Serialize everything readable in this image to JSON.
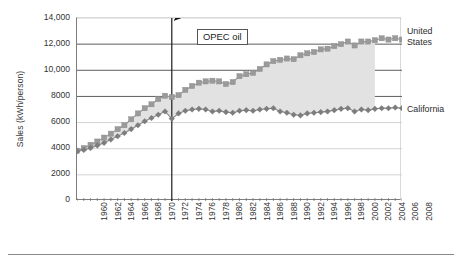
{
  "chart_data": {
    "type": "line",
    "title": "",
    "subtitle": "",
    "xlabel": "",
    "ylabel": "Sales (kWh/person)",
    "xlim": [
      1960,
      2008
    ],
    "ylim": [
      0,
      14000
    ],
    "grid": true,
    "legend_position": "right-of-plot-endpoint-labels",
    "ytick_labels": [
      "14,000",
      "12,000",
      "10,000",
      "8000",
      "6000",
      "4000",
      "2000",
      "0"
    ],
    "ytick_values": [
      14000,
      12000,
      10000,
      8000,
      6000,
      4000,
      2000,
      0
    ],
    "xtick_labels": [
      "1960",
      "1962",
      "1964",
      "1966",
      "1968",
      "1970",
      "1972",
      "1974",
      "1976",
      "1978",
      "1980",
      "1982",
      "1984",
      "1986",
      "1988",
      "1990",
      "1992",
      "1994",
      "1996",
      "1998",
      "2000",
      "2002",
      "2004",
      "2006",
      "2008"
    ],
    "x": [
      1960,
      1961,
      1962,
      1963,
      1964,
      1965,
      1966,
      1967,
      1968,
      1969,
      1970,
      1971,
      1972,
      1973,
      1974,
      1975,
      1976,
      1977,
      1978,
      1979,
      1980,
      1981,
      1982,
      1983,
      1984,
      1985,
      1986,
      1987,
      1988,
      1989,
      1990,
      1991,
      1992,
      1993,
      1994,
      1995,
      1996,
      1997,
      1998,
      1999,
      2000,
      2001,
      2002,
      2003,
      2004,
      2005,
      2006,
      2007,
      2008
    ],
    "series": [
      {
        "name": "United States",
        "marker": "square",
        "color": "#9a9a9a",
        "values": [
          3850,
          4050,
          4300,
          4550,
          4850,
          5150,
          5500,
          5800,
          6250,
          6700,
          7100,
          7400,
          7800,
          8050,
          7950,
          8100,
          8500,
          8800,
          9050,
          9150,
          9200,
          9150,
          8950,
          9100,
          9550,
          9700,
          9800,
          10100,
          10450,
          10700,
          10800,
          10900,
          10850,
          11150,
          11300,
          11400,
          11600,
          11650,
          11850,
          12000,
          12200,
          11900,
          12200,
          12200,
          12300,
          12450,
          12350,
          12450,
          12350
        ]
      },
      {
        "name": "California",
        "marker": "diamond",
        "color": "#8e8e8e",
        "values": [
          3800,
          3900,
          4050,
          4250,
          4450,
          4700,
          4950,
          5200,
          5500,
          5800,
          6100,
          6350,
          6600,
          6850,
          6300,
          6700,
          6900,
          7000,
          7050,
          7000,
          6850,
          6900,
          6800,
          6750,
          6900,
          6950,
          6900,
          7000,
          7050,
          7100,
          6850,
          6750,
          6600,
          6550,
          6700,
          6750,
          6800,
          6850,
          6950,
          7050,
          7100,
          6850,
          7000,
          6950,
          7050,
          7100,
          7100,
          7150,
          7100
        ]
      }
    ],
    "fill_between": {
      "label": "shaded gap between series",
      "color": "#e2e2e2",
      "x_start": 1960,
      "x_end": 2004
    },
    "annotations": [
      {
        "name": "opec-oil-callout",
        "text": "OPEC oil",
        "points_to_year": 1974,
        "vertical_rule_year": 1974
      }
    ],
    "endpoint_labels": [
      {
        "name": "united-states",
        "line1": "United",
        "line2": "States"
      },
      {
        "name": "california",
        "line1": "California",
        "line2": ""
      }
    ]
  }
}
